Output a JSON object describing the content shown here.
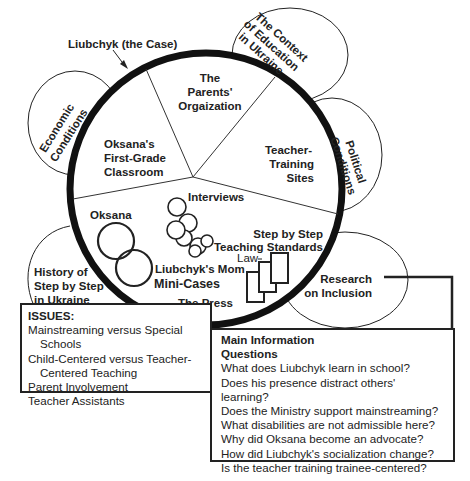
{
  "diagram": {
    "case_label": "Liubchyk (the Case)",
    "outer_contexts": [
      {
        "id": "economic",
        "line1": "Economic",
        "line2": "Conditions"
      },
      {
        "id": "context",
        "line1": "The Context",
        "line2": "of Education",
        "line3": "in Ukraine"
      },
      {
        "id": "political",
        "line1": "Political",
        "line2": "Conditions"
      },
      {
        "id": "research",
        "line1": "Research",
        "line2": "on Inclusion"
      },
      {
        "id": "history",
        "line1": "History of",
        "line2": "Step by Step",
        "line3": "in Ukraine"
      }
    ],
    "segments": {
      "parents": {
        "line1": "The",
        "line2": "Parents'",
        "line3": "Orgaization"
      },
      "classroom": {
        "line1": "Oksana's",
        "line2": "First-Grade",
        "line3": "Classroom"
      },
      "training": {
        "line1": "Teacher-",
        "line2": "Training",
        "line3": "Sites"
      }
    },
    "inner": {
      "interviews": "Interviews",
      "oksana": "Oksana",
      "mom": "Liubchyk's Mom",
      "mini_cases": "Mini-Cases",
      "standards_line1": "Step by Step",
      "standards_line2": "Teaching Standards",
      "law": "Law",
      "press": "The Press"
    },
    "colors": {
      "ink": "#222222",
      "background": "#ffffff"
    }
  },
  "issues": {
    "title": "ISSUES:",
    "items": [
      {
        "line1": "Mainstreaming versus Special",
        "line2": "Schools"
      },
      {
        "line1": "Child-Centered versus Teacher-",
        "line2": "Centered Teaching"
      },
      {
        "line1": "Parent Involvement"
      },
      {
        "line1": "Teacher Assistants"
      }
    ]
  },
  "questions": {
    "title_line1": "Main Information",
    "title_line2": "Questions",
    "items": [
      "What does Liubchyk learn in school?",
      "Does his presence distract others' learning?",
      "Does the Ministry support mainstreaming?",
      "What disabilities are not admissible here?",
      "Why did Oksana become an advocate?",
      "How did Liubchyk's socialization change?",
      "Is the teacher training trainee-centered?"
    ]
  }
}
